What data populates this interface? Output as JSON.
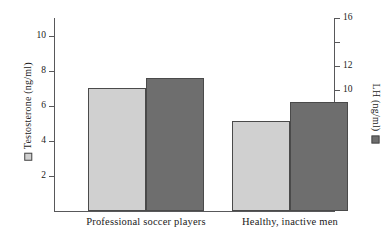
{
  "chart_data": {
    "type": "bar",
    "title": "",
    "xlabel": "",
    "categories": [
      "Professional soccer players",
      "Healthy, inactive men"
    ],
    "grid": false,
    "legend_position": "axis-titles",
    "series": [
      {
        "name": "Testosterone (ng/ml)",
        "axis": "left",
        "color": "#d0d0d0",
        "values": [
          7.0,
          5.15
        ]
      },
      {
        "name": "LH (ng/ml)",
        "axis": "right",
        "color": "#6e6e6e",
        "values": [
          11.0,
          9.0
        ]
      }
    ],
    "axes": {
      "left": {
        "label": "Testosterone (ng/ml)",
        "ylim": [
          0,
          11
        ],
        "ticks": [
          2,
          4,
          6,
          8,
          10
        ],
        "tick_labels": [
          "2",
          "4",
          "6",
          "8",
          "10"
        ]
      },
      "right": {
        "label": "LH (ng/ml)",
        "ylim": [
          0,
          16
        ],
        "ticks": [
          2,
          4,
          6,
          8,
          10,
          12,
          14,
          16
        ],
        "tick_labels": [
          "2",
          "4",
          "6",
          "8",
          "10",
          "12",
          "",
          "16"
        ]
      }
    }
  },
  "legend": {
    "testosterone_swatch": "light-gray-square",
    "lh_swatch": "dark-gray-square"
  }
}
